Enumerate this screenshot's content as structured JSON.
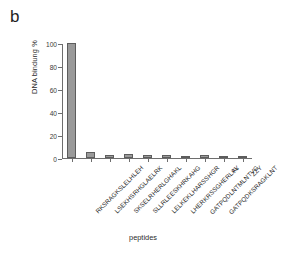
{
  "figure": {
    "panel_label": "b",
    "background_color": "#ffffff"
  },
  "chart_data": {
    "type": "bar",
    "title": "",
    "xlabel": "peptides",
    "ylabel": "DNA bindung %",
    "ylim": [
      0,
      100
    ],
    "yticks": [
      0,
      20,
      40,
      60,
      80,
      100
    ],
    "grid": false,
    "legend": null,
    "bar_color": "#9a9a9a",
    "bar_edge_color": "#5d5d5d",
    "categories": [
      "RKSRAGKSLELHLEH",
      "LSEKHSRHGLAELRK",
      "SKSELRHERLGHAKL",
      "SLLRLEESKHRKAHG",
      "LELKEKLHARSSHGR",
      "LHERKRSSGHERLAL",
      "GATPQDLNTMLNTVG",
      "GATPQDKSRAGKLNT",
      "YY",
      "ZZY"
    ],
    "values": [
      100,
      5.2,
      2.4,
      3.8,
      2.2,
      2.8,
      1.7,
      2.4,
      1.0,
      1.0
    ]
  }
}
